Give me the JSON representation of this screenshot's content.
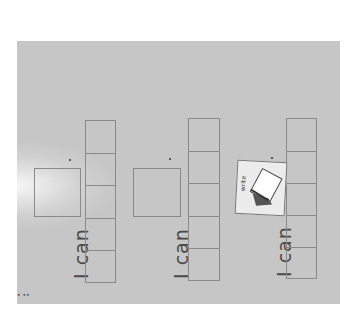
{
  "worksheet": {
    "rows": [
      {
        "label": "I can",
        "picture_box": "empty",
        "letter_boxes": 5
      },
      {
        "label": "I can",
        "picture_box": "empty",
        "letter_boxes": 5
      },
      {
        "label": "I can",
        "picture_box": "card",
        "letter_boxes": 5
      }
    ],
    "card": {
      "text": "write",
      "icon": "pencil-paper-icon"
    },
    "margin_mark": "• ••"
  }
}
